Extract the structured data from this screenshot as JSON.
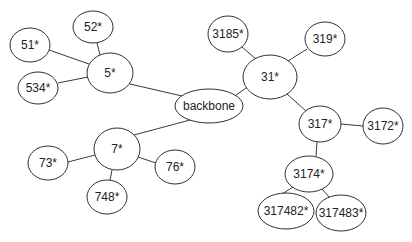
{
  "diagram": {
    "type": "tree",
    "colors": {
      "stroke": "#2f2f2f",
      "fill": "#ffffff",
      "text": "#222222"
    },
    "nodes": [
      {
        "id": "backbone",
        "label": "backbone",
        "cx": 209,
        "cy": 106,
        "rx": 34,
        "ry": 17
      },
      {
        "id": "n5",
        "label": "5*",
        "cx": 110,
        "cy": 73,
        "rx": 23,
        "ry": 20
      },
      {
        "id": "n52",
        "label": "52*",
        "cx": 93,
        "cy": 27,
        "rx": 20,
        "ry": 16
      },
      {
        "id": "n51",
        "label": "51*",
        "cx": 30,
        "cy": 45,
        "rx": 20,
        "ry": 17
      },
      {
        "id": "n534",
        "label": "534*",
        "cx": 38,
        "cy": 88,
        "rx": 20,
        "ry": 16
      },
      {
        "id": "n7",
        "label": "7*",
        "cx": 117,
        "cy": 149,
        "rx": 23,
        "ry": 21
      },
      {
        "id": "n73",
        "label": "73*",
        "cx": 48,
        "cy": 163,
        "rx": 20,
        "ry": 17
      },
      {
        "id": "n76",
        "label": "76*",
        "cx": 175,
        "cy": 167,
        "rx": 20,
        "ry": 17
      },
      {
        "id": "n748",
        "label": "748*",
        "cx": 107,
        "cy": 197,
        "rx": 20,
        "ry": 17
      },
      {
        "id": "n31",
        "label": "31*",
        "cx": 270,
        "cy": 77,
        "rx": 27,
        "ry": 22
      },
      {
        "id": "n3185",
        "label": "3185*",
        "cx": 228,
        "cy": 34,
        "rx": 20,
        "ry": 18
      },
      {
        "id": "n319",
        "label": "319*",
        "cx": 325,
        "cy": 39,
        "rx": 20,
        "ry": 17
      },
      {
        "id": "n317",
        "label": "317*",
        "cx": 320,
        "cy": 124,
        "rx": 21,
        "ry": 18
      },
      {
        "id": "n3172",
        "label": "3172*",
        "cx": 383,
        "cy": 126,
        "rx": 20,
        "ry": 18
      },
      {
        "id": "n3174",
        "label": "3174*",
        "cx": 309,
        "cy": 174,
        "rx": 24,
        "ry": 18
      },
      {
        "id": "n317482",
        "label": "317482*",
        "cx": 286,
        "cy": 211,
        "rx": 28,
        "ry": 18
      },
      {
        "id": "n317483",
        "label": "317483*",
        "cx": 341,
        "cy": 213,
        "rx": 25,
        "ry": 18
      }
    ],
    "edges": [
      {
        "from": "n5",
        "to": "backbone",
        "x1": 130,
        "y1": 84,
        "x2": 182,
        "y2": 96
      },
      {
        "from": "n5",
        "to": "n52",
        "x1": 100,
        "y1": 55,
        "x2": 97,
        "y2": 43
      },
      {
        "from": "n5",
        "to": "n51",
        "x1": 89,
        "y1": 64,
        "x2": 49,
        "y2": 50
      },
      {
        "from": "n5",
        "to": "n534",
        "x1": 88,
        "y1": 77,
        "x2": 58,
        "y2": 83
      },
      {
        "from": "n7",
        "to": "backbone",
        "x1": 134,
        "y1": 135,
        "x2": 190,
        "y2": 120
      },
      {
        "from": "n7",
        "to": "n73",
        "x1": 95,
        "y1": 155,
        "x2": 68,
        "y2": 162
      },
      {
        "from": "n7",
        "to": "n76",
        "x1": 138,
        "y1": 157,
        "x2": 156,
        "y2": 163
      },
      {
        "from": "n7",
        "to": "n748",
        "x1": 112,
        "y1": 170,
        "x2": 110,
        "y2": 180
      },
      {
        "from": "n31",
        "to": "backbone",
        "x1": 246,
        "y1": 88,
        "x2": 225,
        "y2": 103
      },
      {
        "from": "n31",
        "to": "n3185",
        "x1": 256,
        "y1": 59,
        "x2": 242,
        "y2": 47
      },
      {
        "from": "n31",
        "to": "n319",
        "x1": 288,
        "y1": 61,
        "x2": 307,
        "y2": 49
      },
      {
        "from": "n31",
        "to": "n317",
        "x1": 287,
        "y1": 94,
        "x2": 306,
        "y2": 111
      },
      {
        "from": "n317",
        "to": "n3172",
        "x1": 341,
        "y1": 124,
        "x2": 363,
        "y2": 126
      },
      {
        "from": "n317",
        "to": "n3174",
        "x1": 317,
        "y1": 142,
        "x2": 316,
        "y2": 156
      },
      {
        "from": "n3174",
        "to": "n317482",
        "x1": 293,
        "y1": 187,
        "x2": 279,
        "y2": 196
      },
      {
        "from": "n3174",
        "to": "n317483",
        "x1": 322,
        "y1": 189,
        "x2": 330,
        "y2": 198
      }
    ]
  }
}
